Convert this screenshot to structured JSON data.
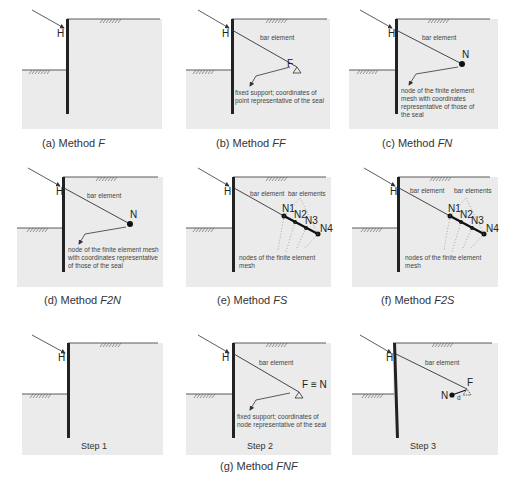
{
  "panels": [
    {
      "id": "a",
      "caption_prefix": "(a) Method ",
      "caption_method": "F",
      "labels": {
        "anchor_head": "H"
      }
    },
    {
      "id": "b",
      "caption_prefix": "(b) Method ",
      "caption_method": "FF",
      "labels": {
        "anchor_head": "H",
        "bar": "bar element",
        "end": "F",
        "note_line1": "fixed support; coordinates of",
        "note_line2": "point representative of the seal"
      }
    },
    {
      "id": "c",
      "caption_prefix": "(c) Method ",
      "caption_method": "FN",
      "labels": {
        "anchor_head": "H",
        "bar": "bar element",
        "end": "N",
        "note_line1": "node of the finite element",
        "note_line2": "mesh with coordinates",
        "note_line3": "representative of those of",
        "note_line4": "the seal"
      }
    },
    {
      "id": "d",
      "caption_prefix": "(d) Method ",
      "caption_method": "F2N",
      "labels": {
        "anchor_head": "H",
        "bar": "bar element",
        "end": "N",
        "note_line1": "node of the finite element mesh",
        "note_line2": "with coordinates representative",
        "note_line3": "of those of the seal"
      }
    },
    {
      "id": "e",
      "caption_prefix": "(e) Method ",
      "caption_method": "FS",
      "labels": {
        "anchor_head": "H",
        "bar": "bar element",
        "bars": "bar elements",
        "n1": "N1",
        "n2": "N2",
        "n3": "N3",
        "n4": "N4",
        "note_line1": "nodes of the finite element",
        "note_line2": "mesh"
      }
    },
    {
      "id": "f",
      "caption_prefix": "(f) Method ",
      "caption_method": "F2S",
      "labels": {
        "anchor_head": "H",
        "bar": "bar element",
        "bars": "bar elements",
        "n1": "N1",
        "n2": "N2",
        "n3": "N3",
        "n4": "N4",
        "note_line1": "nodes of the finite element",
        "note_line2": "mesh"
      }
    },
    {
      "id": "g1",
      "step": "Step 1",
      "labels": {
        "anchor_head": "H"
      }
    },
    {
      "id": "g2",
      "step": "Step 2",
      "labels": {
        "anchor_head": "H",
        "bar": "bar element",
        "end": "F ≡ N",
        "note_line1": "fixed support; coordinates of",
        "note_line2": "node representative of the seal"
      }
    },
    {
      "id": "g3",
      "step": "Step 3",
      "labels": {
        "anchor_head": "H",
        "bar": "bar element",
        "end_f": "F",
        "end_n": "N",
        "offset": "d"
      }
    }
  ],
  "group_caption": {
    "prefix": "(g) Method ",
    "method": "FNF"
  },
  "colors": {
    "soil": "#ebebeb",
    "wall": "#222222",
    "line": "#333333"
  }
}
